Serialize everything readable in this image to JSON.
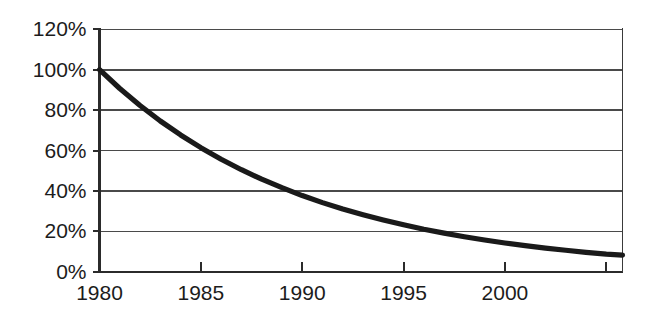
{
  "chart_data": {
    "type": "line",
    "title": "",
    "subtitle": "",
    "xlabel": "",
    "ylabel": "",
    "xlim": [
      1980,
      2005.8
    ],
    "ylim": [
      0,
      120
    ],
    "grid": true,
    "legend": false,
    "legend_position": "none",
    "y_tick_labels": [
      "0%",
      "20%",
      "40%",
      "60%",
      "80%",
      "100%",
      "120%"
    ],
    "y_tick_values": [
      0,
      20,
      40,
      60,
      80,
      100,
      120
    ],
    "x_tick_labels": [
      "1980",
      "1985",
      "1990",
      "1995",
      "2000",
      ""
    ],
    "x_tick_values": [
      1980,
      1985,
      1990,
      1995,
      2000,
      2005
    ],
    "line_color": "#1a1a1a",
    "grid_color": "#4a4a4a",
    "background_color": "#ffffff",
    "series": [
      {
        "name": "",
        "x": [
          1980,
          1981,
          1982,
          1983,
          1984,
          1985,
          1986,
          1987,
          1988,
          1989,
          1990,
          1991,
          1992,
          1993,
          1994,
          1995,
          1996,
          1997,
          1998,
          1999,
          2000,
          2001,
          2002,
          2003,
          2004,
          2005,
          2005.8
        ],
        "values": [
          100,
          90.7,
          82.3,
          74.6,
          67.7,
          61.4,
          55.7,
          50.5,
          45.8,
          41.6,
          37.7,
          34.2,
          31.0,
          28.2,
          25.6,
          23.2,
          21.0,
          19.1,
          17.3,
          15.7,
          14.2,
          12.9,
          11.7,
          10.6,
          9.6,
          8.7,
          8.2
        ]
      }
    ],
    "annotations": [
      {
        "label": "start",
        "x": 1980,
        "y": 100
      },
      {
        "label": "crosses-80%",
        "x": 1982.2,
        "y": 80
      },
      {
        "label": "crosses-60%",
        "x": 1985.2,
        "y": 60
      },
      {
        "label": "crosses-40%",
        "x": 1989.9,
        "y": 40
      },
      {
        "label": "crosses-20%",
        "x": 1996.6,
        "y": 20
      },
      {
        "label": "end",
        "x": 2005.8,
        "y": 8
      }
    ]
  }
}
